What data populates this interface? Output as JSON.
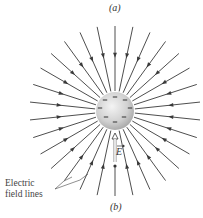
{
  "figure": {
    "caption_top": "(a)",
    "caption_bottom": "(b)",
    "annotation": {
      "line1": "Electric",
      "line2": "field lines"
    },
    "vector_label": "E",
    "sphere": {
      "charge_marks": [
        "−",
        "−",
        "−",
        "−",
        "−",
        "−",
        "−",
        "−",
        "−"
      ],
      "center": [
        115,
        111
      ],
      "radius": 19,
      "fill_light": "#f2f2f2",
      "fill_dark": "#a9a9a9"
    },
    "field_lines": {
      "count": 30,
      "direction": "inward",
      "inner_radius": 20,
      "outer_radius": 86,
      "color": "#3a3a3a"
    }
  }
}
